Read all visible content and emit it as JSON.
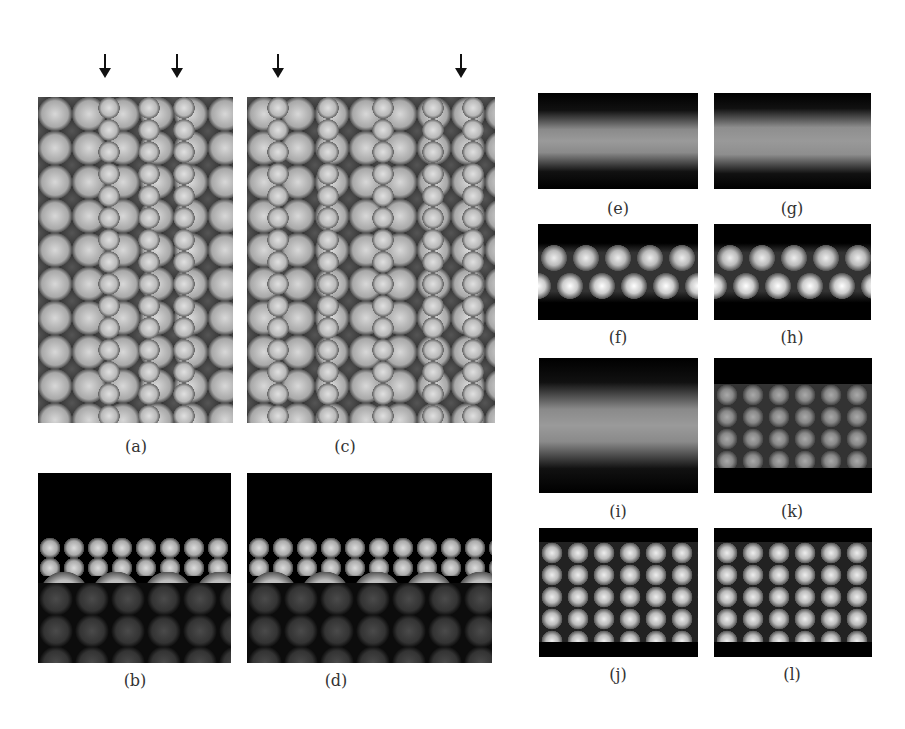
{
  "figure": {
    "panels": [
      {
        "id": "a",
        "label": "(a)",
        "type": "top-view-ball-model",
        "arrows": 2
      },
      {
        "id": "b",
        "label": "(b)",
        "type": "side-view-ball-model"
      },
      {
        "id": "c",
        "label": "(c)",
        "type": "top-view-ball-model",
        "arrows": 2
      },
      {
        "id": "d",
        "label": "(d)",
        "type": "side-view-ball-model"
      },
      {
        "id": "e",
        "label": "(e)",
        "type": "simulated-stm-image"
      },
      {
        "id": "f",
        "label": "(f)",
        "type": "simulated-stm-image"
      },
      {
        "id": "g",
        "label": "(g)",
        "type": "simulated-stm-image"
      },
      {
        "id": "h",
        "label": "(h)",
        "type": "simulated-stm-image"
      },
      {
        "id": "i",
        "label": "(i)",
        "type": "simulated-stm-image"
      },
      {
        "id": "j",
        "label": "(j)",
        "type": "simulated-stm-image"
      },
      {
        "id": "k",
        "label": "(k)",
        "type": "simulated-stm-image"
      },
      {
        "id": "l",
        "label": "(l)",
        "type": "simulated-stm-image"
      }
    ],
    "labels": {
      "a": "(a)",
      "b": "(b)",
      "c": "(c)",
      "d": "(d)",
      "e": "(e)",
      "f": "(f)",
      "g": "(g)",
      "h": "(h)",
      "i": "(i)",
      "j": "(j)",
      "k": "(k)",
      "l": "(l)"
    },
    "arrow_icon": "down-arrow-icon"
  }
}
